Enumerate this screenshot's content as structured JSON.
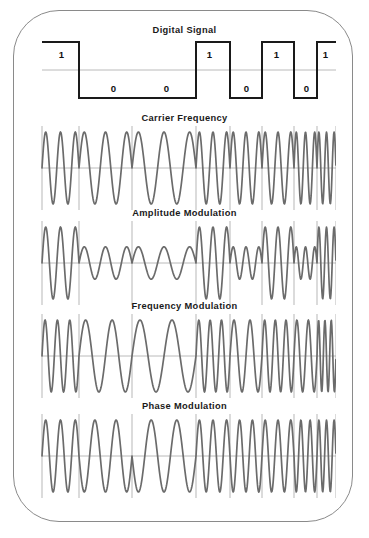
{
  "figure": {
    "frame_color": "#8a8a8a",
    "wave_color": "#6b6b6b",
    "grid_color": "#9a9a9a",
    "axis_color": "#a8a8a8",
    "signal_color": "#1a1a1a",
    "background": "#ffffff"
  },
  "panels": [
    {
      "id": "digital",
      "title": "Digital Signal"
    },
    {
      "id": "carrier",
      "title": "Carrier Frequency"
    },
    {
      "id": "am",
      "title": "Amplitude Modulation"
    },
    {
      "id": "fm",
      "title": "Frequency Modulation"
    },
    {
      "id": "pm",
      "title": "Phase Modulation"
    }
  ],
  "bit_labels": [
    {
      "text": "1",
      "x": 28,
      "y": 18
    },
    {
      "text": "0",
      "x": 80,
      "y": 52
    },
    {
      "text": "0",
      "x": 133,
      "y": 52
    },
    {
      "text": "1",
      "x": 176,
      "y": 18
    },
    {
      "text": "0",
      "x": 213,
      "y": 52
    },
    {
      "text": "1",
      "x": 243,
      "y": 18
    },
    {
      "text": "0",
      "x": 273,
      "y": 52
    },
    {
      "text": "1",
      "x": 292,
      "y": 18
    }
  ],
  "chart_data": {
    "type": "line",
    "xlabel": "",
    "ylabel": "",
    "grid": true,
    "legend": "none",
    "bitstream": [
      1,
      0,
      0,
      1,
      0,
      1,
      0,
      1
    ],
    "bit_count": 8,
    "bit_boundaries_px": [
      8,
      45,
      98,
      162,
      196,
      228,
      260,
      283,
      302
    ],
    "series": [
      {
        "name": "Digital Signal",
        "type": "square",
        "description": "Binary NRZ square wave. High level = bit 1, low level = bit 0.",
        "levels": [
          1,
          0,
          0,
          1,
          0,
          1,
          0,
          1
        ],
        "high_label": "1",
        "low_label": "0"
      },
      {
        "name": "Carrier Frequency",
        "type": "sine",
        "description": "Unmodulated constant-amplitude constant-frequency sinusoid.",
        "amplitude": 1.0,
        "cycles_total": 20,
        "frequency_per_bit": [
          2.5,
          2.5,
          2.5,
          2.5,
          2.5,
          2.5,
          2.5,
          2.5
        ],
        "amplitude_per_bit": [
          1.0,
          1.0,
          1.0,
          1.0,
          1.0,
          1.0,
          1.0,
          1.0
        ],
        "phase_per_bit": [
          0,
          0,
          0,
          0,
          0,
          0,
          0,
          0
        ]
      },
      {
        "name": "Amplitude Modulation",
        "type": "sine",
        "description": "Amplitude Shift Keying (ASK): large amplitude for bit 1, reduced amplitude for bit 0.",
        "amplitude_high": 1.0,
        "amplitude_low": 0.45,
        "amplitude_per_bit": [
          1.0,
          0.45,
          0.45,
          1.0,
          0.45,
          1.0,
          0.45,
          1.0
        ],
        "frequency_per_bit": [
          2.5,
          2.5,
          2.5,
          2.5,
          2.5,
          2.5,
          2.5,
          2.5
        ],
        "phase_per_bit": [
          0,
          0,
          0,
          0,
          0,
          0,
          0,
          0
        ]
      },
      {
        "name": "Frequency Modulation",
        "type": "sine",
        "description": "Frequency Shift Keying (FSK): higher frequency for bit 1, lower frequency for bit 0.",
        "frequency_high": 3.0,
        "frequency_low": 2.0,
        "frequency_per_bit": [
          3.0,
          2.0,
          2.0,
          3.0,
          2.0,
          3.0,
          2.0,
          3.0
        ],
        "amplitude_per_bit": [
          1.0,
          1.0,
          1.0,
          1.0,
          1.0,
          1.0,
          1.0,
          1.0
        ],
        "phase_per_bit": [
          0,
          0,
          0,
          0,
          0,
          0,
          0,
          0
        ]
      },
      {
        "name": "Phase Modulation",
        "type": "sine",
        "description": "Phase Shift Keying (PSK): carrier phase inverted by 180 degrees for bit 0.",
        "phase_shift_degrees": 180,
        "phase_per_bit": [
          0,
          180,
          180,
          0,
          180,
          0,
          180,
          0
        ],
        "amplitude_per_bit": [
          1.0,
          1.0,
          1.0,
          1.0,
          1.0,
          1.0,
          1.0,
          1.0
        ],
        "frequency_per_bit": [
          2.5,
          2.5,
          2.5,
          2.5,
          2.5,
          2.5,
          2.5,
          2.5
        ]
      }
    ]
  }
}
